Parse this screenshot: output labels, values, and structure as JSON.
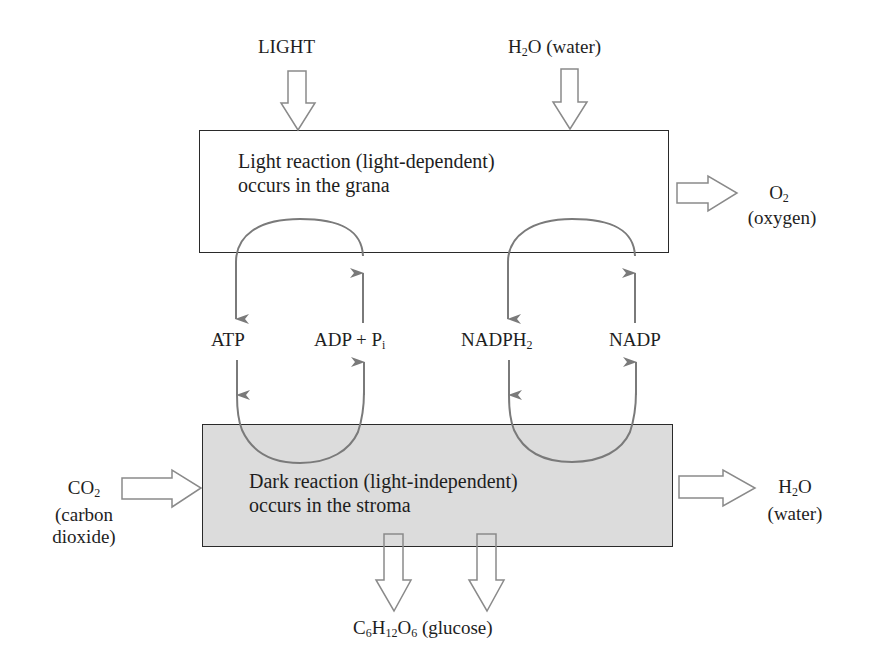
{
  "diagram": {
    "inputs_top": {
      "light": "LIGHT",
      "water": {
        "formula_main": "H",
        "formula_sub": "2",
        "formula_tail": "O",
        "name": " (water)"
      }
    },
    "light_reaction_box": {
      "line1": "Light reaction (light-dependent)",
      "line2": "occurs in the grana",
      "fill": "#ffffff"
    },
    "oxygen_output": {
      "formula_main": "O",
      "formula_sub": "2",
      "name": "(oxygen)"
    },
    "cycle_labels": {
      "atp": "ATP",
      "adp_main": "ADP + P",
      "adp_sub": "i",
      "nadph_main": "NADPH",
      "nadph_sub": "2",
      "nadp": "NADP"
    },
    "dark_reaction_box": {
      "line1": "Dark reaction (light-independent)",
      "line2": "occurs in the stroma",
      "fill": "#dcdcdc"
    },
    "co2_input": {
      "formula_main": "CO",
      "formula_sub": "2",
      "name_line1": "(carbon",
      "name_line2": "dioxide)"
    },
    "water_output": {
      "formula_main": "H",
      "formula_sub": "2",
      "formula_tail": "O",
      "name": "(water)"
    },
    "glucose_output": {
      "c": "C",
      "c_sub": "6",
      "h": "H",
      "h_sub": "12",
      "o": "O",
      "o_sub": "6",
      "name": " (glucose)"
    },
    "colors": {
      "cycle_arrow": "#7a7a7a",
      "box_border": "#2a2a2a",
      "dark_box_fill": "#dcdcdc",
      "block_arrow_stroke": "#8a8a8a"
    }
  }
}
